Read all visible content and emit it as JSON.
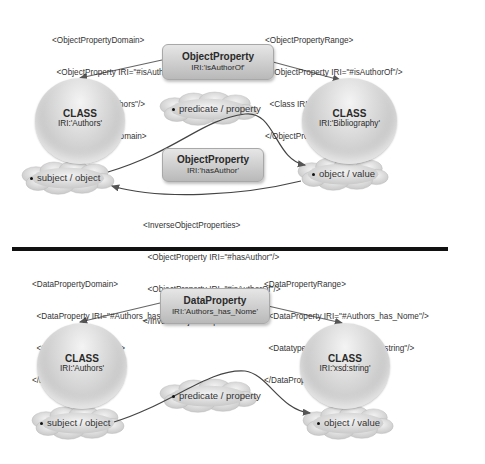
{
  "top": {
    "domain_xml": [
      "<ObjectPropertyDomain>",
      "  <ObjectProperty IRI=\"#isAuthorOf\"/>",
      "  <Class IRI=\"#Authors\"/>",
      "</ObjectPropertyDomain>"
    ],
    "range_xml": [
      "<ObjectPropertyRange>",
      "  <ObjectProperty IRI=\"#isAuthorOf\"/>",
      "  <Class IRI=\"#Bibliography\"/>",
      "</ObjectPropertyRange>"
    ],
    "property_main": {
      "title": "ObjectProperty",
      "iri": "IRI:'isAuthorOf'"
    },
    "property_inverse": {
      "title": "ObjectProperty",
      "iri": "IRI:'hasAuthor'"
    },
    "class_left": {
      "title": "CLASS",
      "iri": "IRI:'Authors'"
    },
    "class_right": {
      "title": "CLASS",
      "iri": "IRI:'Bibliography'"
    },
    "cloud_subject": "subject / object",
    "cloud_predicate": "predicate / property",
    "cloud_object": "object / value",
    "inverse_xml": [
      "<InverseObjectProperties>",
      "  <ObjectProperty IRI=\"#hasAuthor\"/>",
      "  <ObjectProperty IRI=\"#isAuthorOf\"/>",
      "</InverseObjectProperties>"
    ]
  },
  "bottom": {
    "domain_xml": [
      "<DataPropertyDomain>",
      "  <DataProperty IRI=\"#Authors_has_Nome\"/>",
      "  <Class IRI=\"#Authors\"/>",
      "</DataPropertyDomain>"
    ],
    "range_xml": [
      "<DataPropertyRange>",
      "  <DataProperty IRI=\"#Authors_has_Nome\"/>",
      "  <Datatype abbreviatedIRI=\"xsd:string\"/>",
      "</DataPropertyRange>"
    ],
    "property_main": {
      "title": "DataProperty",
      "iri": "IRI:'Authors_has_Nome'"
    },
    "class_left": {
      "title": "CLASS",
      "iri": "IRI:'Authors'"
    },
    "class_right": {
      "title": "CLASS",
      "iri": "IRI:'xsd:string'"
    },
    "cloud_subject": "subject / object",
    "cloud_predicate": "predicate / property",
    "cloud_object": "object / value"
  }
}
